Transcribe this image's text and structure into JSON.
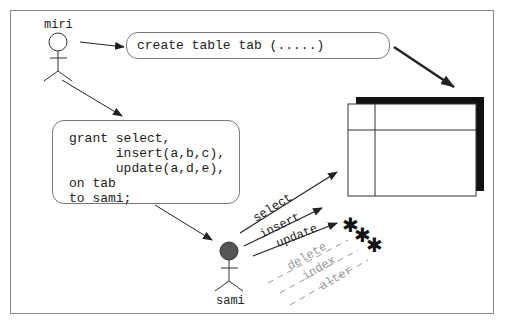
{
  "diagram": {
    "actors": [
      {
        "id": "miri",
        "label": "miri",
        "head_fill": "#ffffff"
      },
      {
        "id": "sami",
        "label": "sami",
        "head_fill": "#555555"
      }
    ],
    "create_statement": "create table tab (.....)",
    "grant_statement": {
      "lines": [
        "grant select,",
        "      insert(a,b,c),",
        "      update(a,d,e),",
        "on tab",
        "to sami;"
      ]
    },
    "granted_privileges": [
      "select",
      "insert",
      "update"
    ],
    "denied_privileges": [
      "delete",
      "index",
      "alter"
    ],
    "denied_marker": "✱✱✱",
    "colors": {
      "line": "#222222",
      "frame": "#8a8a8a",
      "denied": "#999999",
      "table_shadow": "#111111"
    }
  }
}
